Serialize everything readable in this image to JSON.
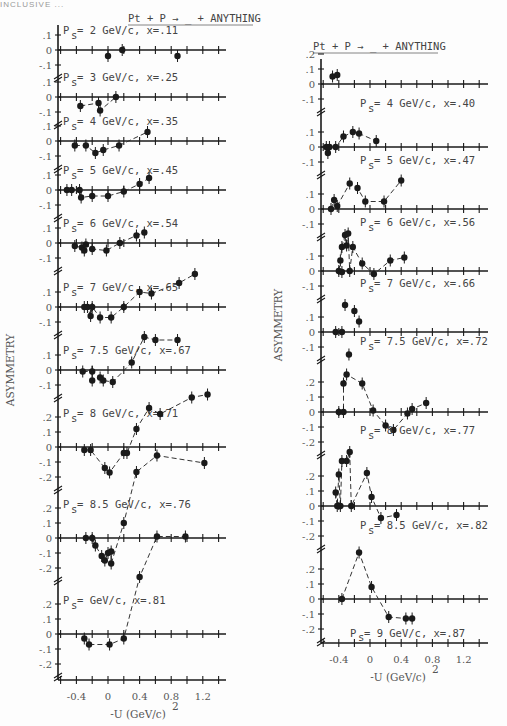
{
  "page_header": "INCLUSIVE ...",
  "chart_data": [
    {
      "type": "scatter",
      "title": "Pt + P → _ + ANYTHING",
      "ylabel": "ASYMMETRY",
      "xlabel": "-U (GeV/c)",
      "xlabel_sup": "2",
      "xticks": [
        -0.4,
        0,
        0.4,
        0.8,
        1.2
      ],
      "xtick_labels": [
        "-0.4",
        "0",
        "0.4",
        "0.8",
        "1.2"
      ],
      "xlim": [
        -0.6,
        1.4
      ],
      "panel": {
        "x0": 50,
        "x_zero": 108,
        "px_per_unit": 79,
        "x_end": 226,
        "bottom_axis_y": 680
      },
      "rows": [
        {
          "label": "P = 2 GeV/c, x =.11",
          "ps": "2 GeV/c",
          "x": ".11",
          "zero_y": 50,
          "px_per_tenth": 15,
          "yticks": [
            ".1",
            "0",
            "-.1"
          ],
          "yvals": [
            0.1,
            0,
            -0.1
          ],
          "curve": false,
          "points": [
            [
              0.0,
              -0.04
            ],
            [
              0.18,
              0.0
            ],
            [
              0.88,
              -0.04
            ]
          ]
        },
        {
          "label": "P = 3 GeV/c, x=.25",
          "ps": "3 GeV/c",
          "x": ".25",
          "zero_y": 97,
          "px_per_tenth": 15,
          "yticks": [
            ".1",
            "0",
            "-.1"
          ],
          "yvals": [
            0.1,
            0,
            -0.1
          ],
          "curve": true,
          "points": [
            [
              -0.35,
              -0.06
            ],
            [
              -0.12,
              -0.04
            ],
            [
              -0.1,
              -0.09
            ],
            [
              0.1,
              0.0
            ]
          ]
        },
        {
          "label": "P = 4 GeV/c, x=.35",
          "ps": "4 GeV/c",
          "x": ".35",
          "zero_y": 141,
          "px_per_tenth": 15,
          "yticks": [
            ".1",
            "0",
            "-.1"
          ],
          "yvals": [
            0.1,
            0,
            -0.1
          ],
          "curve": true,
          "points": [
            [
              -0.42,
              -0.03
            ],
            [
              -0.28,
              -0.03
            ],
            [
              -0.16,
              -0.08
            ],
            [
              -0.06,
              -0.06
            ],
            [
              0.14,
              -0.03
            ],
            [
              0.5,
              0.06
            ]
          ]
        },
        {
          "label": "P = 5 GeV/c, x = .45",
          "ps": "5 GeV/c",
          "x": ".45",
          "zero_y": 190,
          "px_per_tenth": 15,
          "yticks": [
            ".1",
            "0",
            "-.1"
          ],
          "yvals": [
            0.1,
            0,
            -0.1
          ],
          "curve": true,
          "points": [
            [
              -0.52,
              0.0
            ],
            [
              -0.46,
              0.0
            ],
            [
              -0.36,
              0.0
            ],
            [
              -0.34,
              -0.05
            ],
            [
              -0.2,
              -0.04
            ],
            [
              0.0,
              -0.04
            ],
            [
              0.2,
              -0.01
            ],
            [
              0.4,
              0.04
            ],
            [
              0.52,
              0.08
            ]
          ]
        },
        {
          "label": "P = 6 GeV/c, x = .54",
          "ps": "6 GeV/c",
          "x": ".54",
          "zero_y": 243,
          "px_per_tenth": 15,
          "yticks": [
            ".1",
            "0",
            "-.1"
          ],
          "yvals": [
            0.1,
            0,
            -0.1
          ],
          "curve": true,
          "points": [
            [
              -0.42,
              -0.02
            ],
            [
              -0.33,
              -0.03
            ],
            [
              -0.3,
              -0.05
            ],
            [
              -0.28,
              -0.01
            ],
            [
              -0.2,
              -0.04
            ],
            [
              -0.02,
              -0.05
            ],
            [
              0.15,
              0.0
            ],
            [
              0.36,
              0.05
            ],
            [
              0.46,
              0.07
            ]
          ]
        },
        {
          "label": "P = 7 GeV/c, x = .65",
          "ps": "7 GeV/c",
          "x": ".65",
          "zero_y": 307,
          "px_per_tenth": 15,
          "yticks": [
            ".1",
            "0",
            "-.1"
          ],
          "yvals": [
            0.1,
            0,
            -0.1
          ],
          "curve": true,
          "points": [
            [
              -0.3,
              0.0
            ],
            [
              -0.26,
              0.0
            ],
            [
              -0.2,
              0.0
            ],
            [
              -0.22,
              -0.06
            ],
            [
              -0.1,
              -0.07
            ],
            [
              0.04,
              -0.07
            ],
            [
              0.2,
              0.0
            ],
            [
              0.4,
              0.1
            ],
            [
              0.55,
              0.09
            ],
            [
              0.9,
              0.16
            ],
            [
              1.1,
              0.22
            ]
          ]
        },
        {
          "label": "P =7.5 GeV/c, x=.67",
          "ps": "7.5 GeV/c",
          "x": ".67",
          "zero_y": 370,
          "px_per_tenth": 15,
          "yticks": [
            ".1",
            "0",
            "-.1"
          ],
          "yvals": [
            0.1,
            0,
            -0.1
          ],
          "curve": true,
          "points": [
            [
              -0.32,
              -0.01
            ],
            [
              -0.2,
              -0.01
            ],
            [
              -0.2,
              -0.07
            ],
            [
              -0.1,
              -0.05
            ],
            [
              -0.06,
              -0.07
            ],
            [
              0.06,
              -0.08
            ],
            [
              0.3,
              0.05
            ],
            [
              0.46,
              0.22
            ],
            [
              0.6,
              0.2
            ],
            [
              0.88,
              0.2
            ]
          ]
        },
        {
          "label": "P = 8 GeV/c, x= .71",
          "ps": "8 GeV/c",
          "x": ".71",
          "zero_y": 447,
          "px_per_tenth": 15,
          "yticks": [
            ".2",
            ".1",
            "0",
            "-.1",
            "-.2"
          ],
          "yvals": [
            0.2,
            0.1,
            0,
            -0.1,
            -0.2
          ],
          "curve": true,
          "points": [
            [
              -0.3,
              -0.02
            ],
            [
              -0.22,
              -0.02
            ],
            [
              -0.04,
              -0.14
            ],
            [
              0.02,
              -0.17
            ],
            [
              0.2,
              -0.04
            ],
            [
              0.24,
              -0.04
            ],
            [
              0.36,
              0.12
            ],
            [
              0.52,
              0.26
            ],
            [
              0.66,
              0.22
            ],
            [
              1.06,
              0.33
            ],
            [
              1.26,
              0.35
            ]
          ]
        },
        {
          "label": "P = 8.5 GeV/c x=.76",
          "ps": "8.5 GeV/c",
          "x": ".76",
          "zero_y": 538,
          "px_per_tenth": 15,
          "yticks": [
            ".2",
            ".1",
            "0",
            "-.1",
            "-.2"
          ],
          "yvals": [
            0.2,
            0.1,
            0,
            -0.1,
            -0.2
          ],
          "curve": true,
          "points": [
            [
              -0.28,
              0.0
            ],
            [
              -0.2,
              0.0
            ],
            [
              -0.16,
              -0.05
            ],
            [
              -0.08,
              -0.12
            ],
            [
              -0.04,
              -0.15
            ],
            [
              0.0,
              -0.1
            ],
            [
              0.04,
              -0.09
            ],
            [
              0.04,
              -0.17
            ],
            [
              0.2,
              0.1
            ],
            [
              0.36,
              0.44
            ],
            [
              0.62,
              0.55
            ],
            [
              1.22,
              0.5
            ]
          ]
        },
        {
          "label": "P = GeV/c, x=.81",
          "ps": "GeV/c",
          "x": ".81",
          "zero_y": 634,
          "px_per_tenth": 15,
          "yticks": [
            ".2",
            ".1",
            "0",
            "-.1",
            "-.2"
          ],
          "yvals": [
            0.2,
            0.1,
            0,
            -0.1,
            -0.2
          ],
          "curve": true,
          "points": [
            [
              -0.3,
              -0.03
            ],
            [
              -0.24,
              -0.07
            ],
            [
              0.02,
              -0.07
            ],
            [
              0.2,
              -0.03
            ],
            [
              0.4,
              0.38
            ],
            [
              0.62,
              0.65
            ],
            [
              0.98,
              0.65
            ]
          ]
        }
      ]
    },
    {
      "type": "scatter",
      "title": "Pt + P → _ + ANYTHING",
      "ylabel": "ASYMMETRY",
      "xlabel": "-U (GeV/c)",
      "xlabel_sup": "2",
      "xticks": [
        -0.4,
        0,
        0.4,
        0.8,
        1.2
      ],
      "xtick_labels": [
        "-0.4",
        "0",
        "0.4",
        "0.8",
        "1.2"
      ],
      "xlim": [
        -0.6,
        1.4
      ],
      "panel": {
        "x0": 313,
        "x_zero": 370,
        "px_per_unit": 78,
        "x_end": 488,
        "bottom_axis_y": 643
      },
      "rows": [
        {
          "label": "",
          "ps": "",
          "x": "",
          "zero_y": 84,
          "px_per_tenth": 15,
          "yticks": [
            ".2",
            ".1",
            "0",
            "-.1"
          ],
          "yvals": [
            0.2,
            0.1,
            0,
            -0.1
          ],
          "curve": false,
          "points": [
            [
              -0.48,
              0.05
            ],
            [
              -0.42,
              0.06
            ]
          ]
        },
        {
          "label": "P = 4 GeV/c, x= .40",
          "ps": "4 GeV/c",
          "x": ".40",
          "zero_y": 147,
          "px_per_tenth": 15,
          "yticks": [
            ".1",
            "0",
            "-.1"
          ],
          "yvals": [
            0.1,
            0,
            -0.1
          ],
          "curve": true,
          "points": [
            [
              -0.56,
              0.0
            ],
            [
              -0.54,
              -0.04
            ],
            [
              -0.52,
              0.0
            ],
            [
              -0.44,
              0.0
            ],
            [
              -0.34,
              0.07
            ],
            [
              -0.22,
              0.1
            ],
            [
              -0.14,
              0.09
            ],
            [
              0.08,
              0.04
            ]
          ]
        },
        {
          "label": "P = 5 GeV/c, x = .47",
          "ps": "5 GeV/c",
          "x": ".47",
          "zero_y": 209,
          "px_per_tenth": 15,
          "yticks": [
            ".1",
            "0",
            "-.1"
          ],
          "yvals": [
            0.1,
            0,
            -0.1
          ],
          "curve": true,
          "points": [
            [
              -0.5,
              0.0
            ],
            [
              -0.46,
              0.06
            ],
            [
              -0.42,
              0.02
            ],
            [
              -0.26,
              0.17
            ],
            [
              -0.16,
              0.14
            ],
            [
              -0.06,
              0.05
            ],
            [
              0.18,
              0.05
            ],
            [
              0.4,
              0.19
            ]
          ]
        },
        {
          "label": "P = 6 GeV/c, x = .56",
          "ps": "6 GeV/c",
          "x": ".56",
          "zero_y": 271,
          "px_per_tenth": 15,
          "yticks": [
            ".1",
            "0",
            "-.1"
          ],
          "yvals": [
            0.1,
            0,
            -0.1
          ],
          "curve": true,
          "points": [
            [
              -0.4,
              0.0
            ],
            [
              -0.38,
              0.07
            ],
            [
              -0.36,
              0.16
            ],
            [
              -0.32,
              0.24
            ],
            [
              -0.28,
              0.25
            ],
            [
              -0.3,
              0.17
            ],
            [
              -0.22,
              0.16
            ],
            [
              -0.26,
              0.0
            ],
            [
              -0.1,
              0.05
            ],
            [
              0.05,
              -0.02
            ],
            [
              0.26,
              0.07
            ],
            [
              0.44,
              0.09
            ]
          ]
        },
        {
          "label": "P = 7 GeV/c, x=.66",
          "ps": "7 GeV/c",
          "x": ".66",
          "zero_y": 332,
          "px_per_tenth": 15,
          "yticks": [
            ".1",
            "0",
            "-.1"
          ],
          "yvals": [
            0.1,
            0,
            -0.1
          ],
          "curve": false,
          "points": [
            [
              -0.36,
              0.4
            ],
            [
              -0.32,
              0.18
            ],
            [
              -0.27,
              -0.15
            ],
            [
              -0.44,
              0.0
            ],
            [
              -0.36,
              0.0
            ],
            [
              -0.2,
              0.14
            ],
            [
              -0.14,
              0.07
            ]
          ]
        },
        {
          "label": "P = 7.5 GeV/c, x=.72",
          "ps": "7.5 GeV/c",
          "x": ".72",
          "zero_y": 412,
          "px_per_tenth": 15,
          "yticks": [
            ".2",
            ".1",
            "0",
            "-.1",
            "-.2"
          ],
          "yvals": [
            0.2,
            0.1,
            0,
            -0.1,
            -0.2
          ],
          "curve": true,
          "points": [
            [
              -0.4,
              0.0
            ],
            [
              -0.34,
              0.0
            ],
            [
              -0.34,
              0.19
            ],
            [
              -0.3,
              0.25
            ],
            [
              -0.1,
              0.19
            ],
            [
              0.04,
              0.01
            ],
            [
              0.2,
              -0.09
            ],
            [
              0.3,
              -0.12
            ],
            [
              0.48,
              -0.01
            ],
            [
              0.54,
              0.02
            ],
            [
              0.72,
              0.06
            ]
          ]
        },
        {
          "label": "P = 8 GeV/c, x=.77",
          "ps": "8 GeV/c",
          "x": ".77",
          "zero_y": 506,
          "px_per_tenth": 15,
          "yticks": [
            ".2",
            ".1",
            "0",
            "-.1",
            "-.2"
          ],
          "yvals": [
            0.2,
            0.1,
            0,
            -0.1,
            -0.2
          ],
          "curve": true,
          "points": [
            [
              -0.44,
              0.09
            ],
            [
              -0.42,
              0.0
            ],
            [
              -0.38,
              0.0
            ],
            [
              -0.4,
              0.21
            ],
            [
              -0.36,
              0.3
            ],
            [
              -0.3,
              0.3
            ],
            [
              -0.26,
              0.36
            ],
            [
              -0.24,
              0.0
            ],
            [
              -0.04,
              0.22
            ],
            [
              0.02,
              0.06
            ],
            [
              0.14,
              -0.08
            ],
            [
              0.34,
              -0.06
            ]
          ]
        },
        {
          "label": "P = 8.5 GeV/c, x=.82",
          "ps": "8.5 GeV/c",
          "x": ".82",
          "zero_y": 599,
          "px_per_tenth": 15,
          "yticks": [
            ".2",
            ".1",
            "0",
            "-.1",
            "-.2"
          ],
          "yvals": [
            0.2,
            0.1,
            0,
            -0.1,
            -0.2
          ],
          "curve": true,
          "points": [
            [
              -0.36,
              0.0
            ],
            [
              -0.14,
              0.31
            ],
            [
              0.02,
              0.08
            ],
            [
              0.24,
              -0.12
            ],
            [
              0.54,
              -0.13
            ],
            [
              0.46,
              -0.13
            ]
          ]
        },
        {
          "label": "P = 9 GeV/c, x=.87",
          "ps": "9 GeV/c",
          "x": ".87",
          "zero_y": 643,
          "px_per_tenth": 15,
          "yticks": [],
          "yvals": [],
          "curve": false,
          "points": [],
          "is_label_only": true
        }
      ]
    }
  ]
}
